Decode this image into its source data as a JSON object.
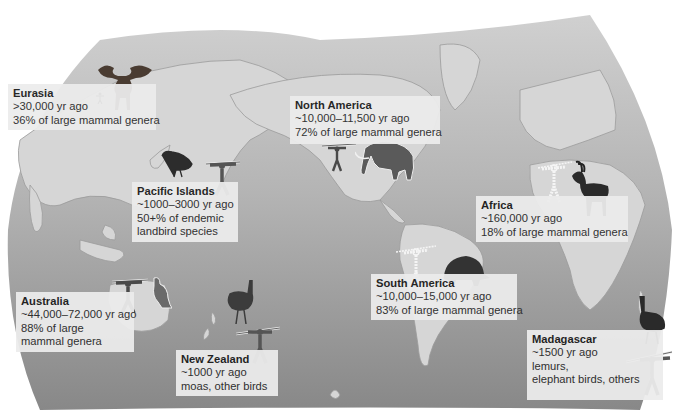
{
  "figure": {
    "colors": {
      "background": "#ffffff",
      "ocean_light": "#c9c9c9",
      "ocean_dark": "#8f8f8f",
      "land": "#dadada",
      "coast": "#9a9a9a",
      "label_box": "#ececec",
      "text": "#2a2a2a"
    }
  },
  "regions": [
    {
      "id": "eurasia",
      "name": "Eurasia",
      "time": ">30,000 yr ago",
      "lines": [
        "36% of large mammal genera"
      ],
      "icons": [
        "human-figure-icon",
        "giant-deer-icon"
      ]
    },
    {
      "id": "north-america",
      "name": "North America",
      "time": "~10,000–11,500 yr ago",
      "lines": [
        "72% of large mammal genera"
      ],
      "icons": [
        "spear-hunter-icon",
        "mammoth-icon"
      ]
    },
    {
      "id": "pacific-islands",
      "name": "Pacific Islands",
      "time": "~1000–3000 yr ago",
      "lines": [
        "50+% of endemic",
        "landbird species"
      ],
      "icons": [
        "flightless-bird-icon",
        "spear-hunter-icon"
      ]
    },
    {
      "id": "africa",
      "name": "Africa",
      "time": "~160,000 yr ago",
      "lines": [
        "18% of large mammal genera"
      ],
      "icons": [
        "spear-hunter-outline-icon",
        "antelope-icon"
      ]
    },
    {
      "id": "australia",
      "name": "Australia",
      "time": "~44,000–72,000 yr ago",
      "lines": [
        "88% of large",
        "mammal genera"
      ],
      "icons": [
        "spear-hunter-icon",
        "giant-kangaroo-icon"
      ]
    },
    {
      "id": "new-zealand",
      "name": "New Zealand",
      "time": "~1000 yr ago",
      "lines": [
        "moas, other birds"
      ],
      "icons": [
        "moa-icon",
        "spear-hunter-icon"
      ]
    },
    {
      "id": "south-america",
      "name": "South America",
      "time": "~10,000–15,000 yr ago",
      "lines": [
        "83% of large mammal genera"
      ],
      "icons": [
        "spear-hunter-outline-icon",
        "glyptodont-icon"
      ]
    },
    {
      "id": "madagascar",
      "name": "Madagascar",
      "time": "~1500 yr ago",
      "lines": [
        "lemurs,",
        "elephant birds, others"
      ],
      "icons": [
        "elephant-bird-icon",
        "spear-hunter-icon"
      ]
    }
  ]
}
